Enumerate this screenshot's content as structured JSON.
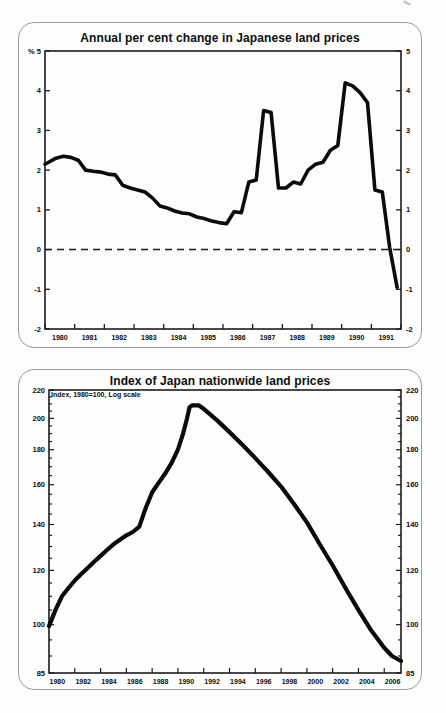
{
  "page": {
    "corner_artifact": "partial-glyph-top-right"
  },
  "colors": {
    "line": "#0b0b0b",
    "axis": "#1c1c1c",
    "panel_border": "#9a9a9a",
    "text": "#0d0d0d"
  },
  "chart_data": [
    {
      "type": "line",
      "title": "Annual per cent change in Japanese land prices",
      "unit_label": "%",
      "log": false,
      "xlim": [
        1980,
        1992
      ],
      "ylim": [
        -2,
        5
      ],
      "yticks": [
        5,
        4,
        3,
        2,
        1,
        0,
        -1,
        -2
      ],
      "ytick_labels_left": [
        "% 5",
        "4",
        "3",
        "2",
        "1",
        "0",
        "-1",
        "-2"
      ],
      "ytick_labels_right": [
        "5",
        "4",
        "3",
        "2",
        "1",
        "0",
        "-1",
        "-2"
      ],
      "xticks": [
        1980,
        1981,
        1982,
        1983,
        1984,
        1985,
        1986,
        1987,
        1988,
        1989,
        1990,
        1991,
        1992
      ],
      "xtick_labels": [
        "1980",
        "1981",
        "1982",
        "1983",
        "1984",
        "1985",
        "1986",
        "1987",
        "1988",
        "1989",
        "1990",
        "1991"
      ],
      "xlabel_offset": 0.5,
      "zero_line_dashed": true,
      "grid": false,
      "legend": "none",
      "points": [
        [
          1980.0,
          2.15
        ],
        [
          1980.12,
          2.2
        ],
        [
          1980.37,
          2.3
        ],
        [
          1980.62,
          2.35
        ],
        [
          1980.87,
          2.32
        ],
        [
          1981.12,
          2.25
        ],
        [
          1981.37,
          2.0
        ],
        [
          1981.62,
          1.97
        ],
        [
          1981.87,
          1.95
        ],
        [
          1982.12,
          1.9
        ],
        [
          1982.37,
          1.88
        ],
        [
          1982.62,
          1.62
        ],
        [
          1982.87,
          1.55
        ],
        [
          1983.12,
          1.5
        ],
        [
          1983.37,
          1.45
        ],
        [
          1983.62,
          1.3
        ],
        [
          1983.87,
          1.1
        ],
        [
          1984.12,
          1.05
        ],
        [
          1984.37,
          0.97
        ],
        [
          1984.62,
          0.92
        ],
        [
          1984.87,
          0.9
        ],
        [
          1985.12,
          0.82
        ],
        [
          1985.37,
          0.78
        ],
        [
          1985.62,
          0.72
        ],
        [
          1985.87,
          0.68
        ],
        [
          1986.12,
          0.65
        ],
        [
          1986.37,
          0.95
        ],
        [
          1986.62,
          0.93
        ],
        [
          1986.87,
          1.7
        ],
        [
          1987.12,
          1.75
        ],
        [
          1987.37,
          3.5
        ],
        [
          1987.62,
          3.45
        ],
        [
          1987.87,
          1.55
        ],
        [
          1988.12,
          1.55
        ],
        [
          1988.37,
          1.7
        ],
        [
          1988.62,
          1.65
        ],
        [
          1988.87,
          2.0
        ],
        [
          1989.12,
          2.15
        ],
        [
          1989.37,
          2.2
        ],
        [
          1989.62,
          2.5
        ],
        [
          1989.87,
          2.62
        ],
        [
          1990.12,
          4.2
        ],
        [
          1990.37,
          4.12
        ],
        [
          1990.62,
          3.95
        ],
        [
          1990.87,
          3.7
        ],
        [
          1991.12,
          1.5
        ],
        [
          1991.37,
          1.45
        ],
        [
          1991.62,
          0.05
        ],
        [
          1991.87,
          -0.95
        ]
      ]
    },
    {
      "type": "line",
      "title": "Index of Japan nationwide land prices",
      "note": "Index, 1980=100, Log scale",
      "log": true,
      "xlim": [
        1980,
        2007.3
      ],
      "ylim": [
        85,
        220
      ],
      "yticks_labeled": [
        220,
        200,
        180,
        160,
        140,
        120,
        100,
        85
      ],
      "ytick_minor_step": 5,
      "xticks_step": 2,
      "xtick_years": [
        1980,
        1982,
        1984,
        1986,
        1988,
        1990,
        1992,
        1994,
        1996,
        1998,
        2000,
        2002,
        2004,
        2006
      ],
      "xlabel_offset": 0.65,
      "grid": false,
      "legend": "none",
      "points": [
        [
          1980.0,
          99.5
        ],
        [
          1980.5,
          105
        ],
        [
          1981,
          110
        ],
        [
          1981.5,
          113
        ],
        [
          1982,
          116
        ],
        [
          1982.5,
          118.5
        ],
        [
          1983,
          121
        ],
        [
          1983.5,
          123.5
        ],
        [
          1984,
          126
        ],
        [
          1984.5,
          128.5
        ],
        [
          1985,
          131
        ],
        [
          1985.5,
          133
        ],
        [
          1986,
          135
        ],
        [
          1986.5,
          136.5
        ],
        [
          1987,
          139
        ],
        [
          1987.5,
          148
        ],
        [
          1988,
          156
        ],
        [
          1988.5,
          161
        ],
        [
          1989,
          166
        ],
        [
          1989.5,
          172
        ],
        [
          1990,
          180
        ],
        [
          1990.4,
          190
        ],
        [
          1990.7,
          200
        ],
        [
          1990.9,
          207.5
        ],
        [
          1991.1,
          209
        ],
        [
          1991.6,
          209
        ],
        [
          1992,
          206.5
        ],
        [
          1993,
          199
        ],
        [
          1994,
          191
        ],
        [
          1995,
          183
        ],
        [
          1996,
          175
        ],
        [
          1997,
          167
        ],
        [
          1998,
          159
        ],
        [
          1999,
          150
        ],
        [
          2000,
          141
        ],
        [
          2001,
          131
        ],
        [
          2002,
          122
        ],
        [
          2003,
          113
        ],
        [
          2004,
          105
        ],
        [
          2005,
          98
        ],
        [
          2006,
          92.5
        ],
        [
          2006.6,
          90
        ],
        [
          2007.3,
          88.5
        ]
      ]
    }
  ]
}
